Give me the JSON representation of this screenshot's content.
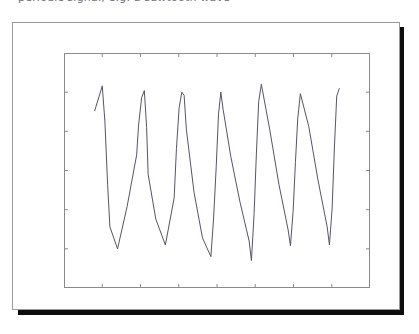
{
  "page": {
    "clipped_top_text": "periodic signal, e.g. a sawtooth wave"
  },
  "figure": {
    "background_color": "#ffffff",
    "border_color": "#9a9a9a",
    "shadow_color": "#0d0d0d"
  },
  "chart_data": {
    "type": "line",
    "title": "",
    "xlabel": "",
    "ylabel": "",
    "xlim": [
      -4,
      4
    ],
    "ylim": [
      -1.5,
      1.5
    ],
    "grid": false,
    "legend": null,
    "line_color": "#555566",
    "line_width": 1.0,
    "xticks": [
      -4,
      -3,
      -2,
      -1,
      0,
      1,
      2,
      3,
      4
    ],
    "xtick_labels": [
      "-4",
      "-3",
      "-2",
      "-1",
      "0",
      "1",
      "2",
      "3",
      "4"
    ],
    "yticks": [
      -1.5,
      -1.0,
      -0.5,
      0.0,
      0.5,
      1.0,
      1.5
    ],
    "ytick_labels": [
      "-1.5",
      "-1.0",
      "-0.5",
      "0.0",
      "0.5",
      "1.0",
      "1.5"
    ],
    "series": [
      {
        "name": "sawtooth partial sum",
        "x": [
          -3.2,
          -3.08,
          -3.0,
          -2.93,
          -2.86,
          -2.8,
          -2.6,
          -2.35,
          -2.1,
          -2.05,
          -1.97,
          -1.9,
          -1.84,
          -1.8,
          -1.6,
          -1.35,
          -1.12,
          -1.06,
          -0.99,
          -0.92,
          -0.86,
          -0.8,
          -0.6,
          -0.38,
          -0.16,
          -0.09,
          -0.02,
          0.04,
          0.1,
          0.16,
          0.36,
          0.6,
          0.84,
          0.9,
          0.97,
          1.03,
          1.09,
          1.16,
          1.38,
          1.62,
          1.86,
          1.92,
          1.99,
          2.05,
          2.11,
          2.18,
          2.4,
          2.64,
          2.88,
          2.94,
          3.01,
          3.07,
          3.13,
          3.2
        ],
        "y": [
          0.76,
          0.95,
          1.08,
          0.62,
          -0.18,
          -0.72,
          -1.0,
          -0.46,
          0.2,
          0.58,
          0.93,
          1.02,
          0.55,
          -0.05,
          -0.62,
          -0.95,
          -0.35,
          0.28,
          0.8,
          1.0,
          0.96,
          0.52,
          -0.28,
          -0.86,
          -1.1,
          -0.62,
          0.05,
          0.72,
          1.0,
          0.78,
          0.18,
          -0.4,
          -0.9,
          -1.15,
          -0.55,
          0.22,
          0.88,
          1.1,
          0.52,
          -0.18,
          -0.76,
          -0.96,
          -0.52,
          0.1,
          0.66,
          0.98,
          0.56,
          -0.12,
          -0.72,
          -0.95,
          -0.48,
          0.3,
          0.95,
          1.05
        ]
      }
    ]
  }
}
